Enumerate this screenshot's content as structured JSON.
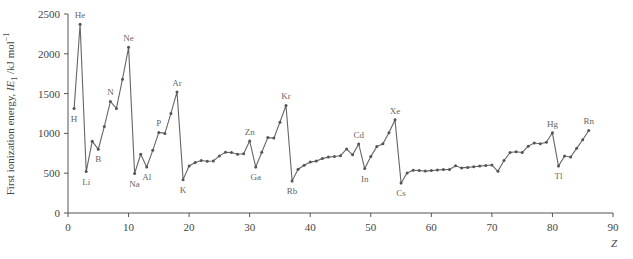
{
  "chart_data": {
    "type": "line",
    "title": "",
    "xlabel": "Z",
    "ylabel": "First ionization energy, IE1 /kJ mol-1",
    "ylabel_parts": {
      "prefix": "First ionization energy, ",
      "italic": "IE",
      "sub": "1",
      "unit": " /kJ mol",
      "sup": "−1"
    },
    "xlim": [
      0,
      90
    ],
    "ylim": [
      0,
      2500
    ],
    "xticks": [
      0,
      10,
      20,
      30,
      40,
      50,
      60,
      70,
      80,
      90
    ],
    "yticks": [
      0,
      500,
      1000,
      1500,
      2000,
      2500
    ],
    "grid": false,
    "legend": null,
    "series": [
      {
        "name": "First ionization energy",
        "color": "#666666",
        "x": [
          1,
          2,
          3,
          4,
          5,
          6,
          7,
          8,
          9,
          10,
          11,
          12,
          13,
          14,
          15,
          16,
          17,
          18,
          19,
          20,
          21,
          22,
          23,
          24,
          25,
          26,
          27,
          28,
          29,
          30,
          31,
          32,
          33,
          34,
          35,
          36,
          37,
          38,
          39,
          40,
          41,
          42,
          43,
          44,
          45,
          46,
          47,
          48,
          49,
          50,
          51,
          52,
          53,
          54,
          55,
          56,
          57,
          58,
          59,
          60,
          61,
          62,
          63,
          64,
          65,
          66,
          67,
          68,
          69,
          70,
          71,
          72,
          73,
          74,
          75,
          76,
          77,
          78,
          79,
          80,
          81,
          82,
          83,
          84,
          85,
          86
        ],
        "values": [
          1312,
          2372,
          520,
          900,
          801,
          1086,
          1402,
          1314,
          1681,
          2081,
          496,
          738,
          578,
          787,
          1012,
          1000,
          1251,
          1521,
          419,
          590,
          633,
          659,
          651,
          653,
          717,
          762,
          760,
          737,
          745,
          906,
          579,
          762,
          947,
          941,
          1140,
          1351,
          403,
          550,
          600,
          640,
          652,
          684,
          702,
          710,
          720,
          804,
          731,
          868,
          558,
          709,
          834,
          869,
          1008,
          1170,
          376,
          503,
          538,
          534,
          527,
          533,
          540,
          545,
          547,
          593,
          566,
          573,
          581,
          589,
          597,
          603,
          524,
          659,
          761,
          770,
          760,
          840,
          880,
          870,
          890,
          1007,
          589,
          716,
          703,
          812,
          920,
          1037
        ]
      }
    ],
    "annotations": [
      {
        "text": "H",
        "z": 1,
        "pos": "below"
      },
      {
        "text": "He",
        "z": 2,
        "pos": "above"
      },
      {
        "text": "Li",
        "z": 3,
        "pos": "below"
      },
      {
        "text": "B",
        "z": 5,
        "pos": "below"
      },
      {
        "text": "N",
        "z": 7,
        "pos": "above"
      },
      {
        "text": "Ne",
        "z": 10,
        "pos": "above"
      },
      {
        "text": "Na",
        "z": 11,
        "pos": "below"
      },
      {
        "text": "Al",
        "z": 13,
        "pos": "below"
      },
      {
        "text": "P",
        "z": 15,
        "pos": "above"
      },
      {
        "text": "Ar",
        "z": 18,
        "pos": "above"
      },
      {
        "text": "K",
        "z": 19,
        "pos": "below"
      },
      {
        "text": "Zn",
        "z": 30,
        "pos": "above"
      },
      {
        "text": "Ga",
        "z": 31,
        "pos": "below"
      },
      {
        "text": "Kr",
        "z": 36,
        "pos": "above"
      },
      {
        "text": "Rb",
        "z": 37,
        "pos": "below"
      },
      {
        "text": "Cd",
        "z": 48,
        "pos": "above"
      },
      {
        "text": "In",
        "z": 49,
        "pos": "below"
      },
      {
        "text": "Xe",
        "z": 54,
        "pos": "above"
      },
      {
        "text": "Cs",
        "z": 55,
        "pos": "below"
      },
      {
        "text": "Hg",
        "z": 80,
        "pos": "above"
      },
      {
        "text": "Tl",
        "z": 81,
        "pos": "below"
      },
      {
        "text": "Rn",
        "z": 86,
        "pos": "above"
      }
    ]
  }
}
